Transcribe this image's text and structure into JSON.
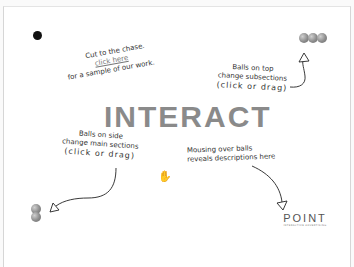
{
  "heading": "INTERACT",
  "intro": {
    "line1": "Cut to the chase.",
    "link": "click here",
    "line3": "for a sample of our work."
  },
  "top_note": {
    "line1": "Balls on top",
    "line2": "change subsections",
    "line3": "(click or drag)"
  },
  "side_note": {
    "line1": "Balls on side",
    "line2": "change main sections",
    "line3": "(click or drag)"
  },
  "hover_note": {
    "line1": "Mousing over balls",
    "line2": "reveals descriptions here"
  },
  "logo": {
    "name": "POINT",
    "tagline": "INTERACTIVE ADVERTISING"
  },
  "colors": {
    "heading": "#8a8a8a",
    "ball": "#8c8c8c",
    "ink": "#333333"
  }
}
